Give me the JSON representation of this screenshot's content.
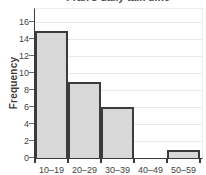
{
  "chart_data": {
    "type": "bar",
    "subtype": "histogram",
    "title": "Fran's daily talk time",
    "title_note_visible_portion": "clipped at top edge of screenshot",
    "categories": [
      "10–19",
      "20–29",
      "30–39",
      "40–49",
      "50–59"
    ],
    "values": [
      15,
      9,
      6,
      0,
      1
    ],
    "xlabel": "",
    "ylabel": "Frequency",
    "ylim": [
      0,
      17.5
    ],
    "yticks": [
      0,
      2,
      4,
      6,
      8,
      10,
      12,
      14,
      16
    ],
    "grid": true,
    "legend": "none",
    "bar_fill": "#d8d8d8",
    "bar_border": "#3b3b3b",
    "axis_color": "#3b3b3b",
    "gridline_color": "#e9e9e9",
    "text_color": "#444444",
    "background": "#ffffff"
  }
}
